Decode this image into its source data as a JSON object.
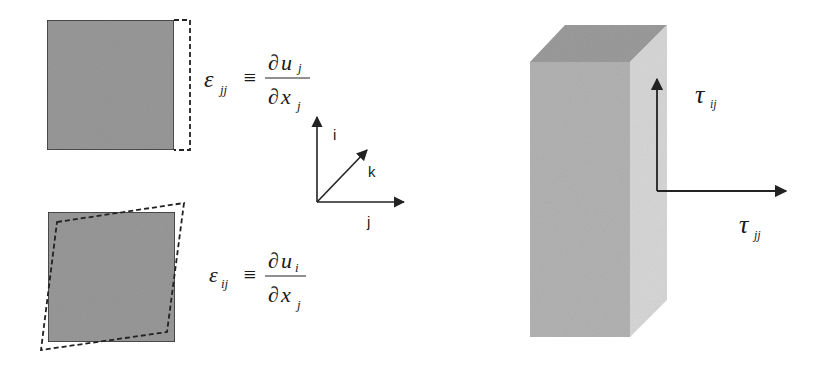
{
  "normal_strain": {
    "symbol": "ε",
    "subscript": "jj",
    "equiv": "≡",
    "numerator": {
      "d": "∂",
      "var": "u",
      "sub": "j"
    },
    "denominator": {
      "d": "∂",
      "var": "x",
      "sub": "j"
    }
  },
  "shear_strain": {
    "symbol": "ε",
    "subscript": "ij",
    "equiv": "≡",
    "numerator": {
      "d": "∂",
      "var": "u",
      "sub": "i"
    },
    "denominator": {
      "d": "∂",
      "var": "x",
      "sub": "j"
    }
  },
  "axes": {
    "up": "i",
    "diagonal": "k",
    "right": "j"
  },
  "stresses": {
    "vertical": {
      "symbol": "τ",
      "sub": "ij"
    },
    "horizontal": {
      "symbol": "τ",
      "sub": "jj"
    }
  },
  "colors": {
    "square_fill": "#9a9a9a",
    "block_front": "#b4b4b4",
    "block_top": "#9c9c9c",
    "block_side": "#d8d8d8",
    "line": "#222222"
  }
}
